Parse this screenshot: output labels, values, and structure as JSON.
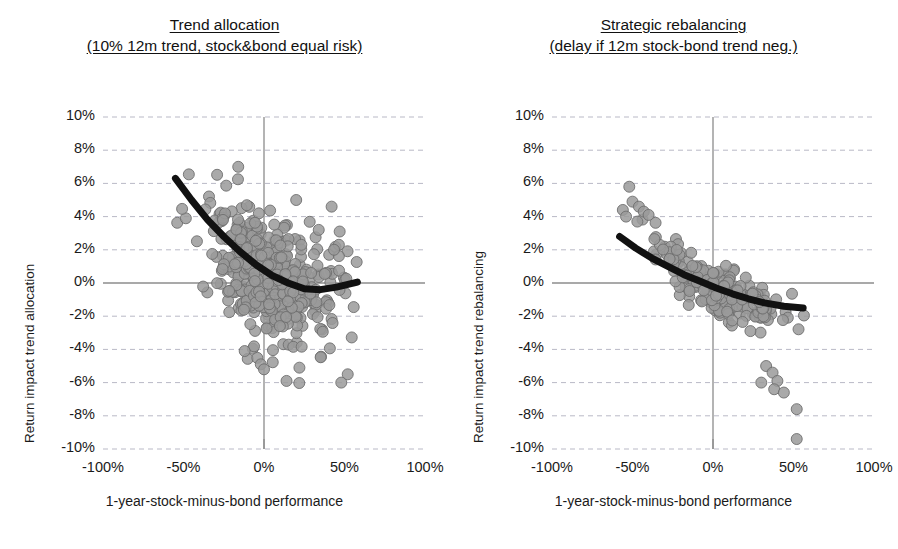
{
  "figure": {
    "width": 898,
    "height": 549,
    "background": "#ffffff",
    "point_color": "#9a9a9a",
    "point_edge_color": "#6e6e6e",
    "trend_color": "#111111",
    "gridline_color": "#b9b9c6",
    "axis_line_color": "#8c8c8c"
  },
  "panels": [
    {
      "id": "trend-allocation",
      "title_line1": "Trend allocation",
      "title_line2": "(10% 12m trend, stock&bond equal risk)",
      "ylabel": "Return impact trend allocation",
      "xlabel": "1-year-stock-minus-bond performance"
    },
    {
      "id": "strategic-rebalancing",
      "title_line1": "Strategic rebalancing",
      "title_line2": "(delay if 12m stock-bond trend neg.)",
      "ylabel": "Return impact trend rebalancing",
      "xlabel": "1-year-stock-minus-bond performance"
    }
  ],
  "chart_data": [
    {
      "type": "scatter",
      "panel": "left",
      "title": "Trend allocation (10% 12m trend, stock&bond equal risk)",
      "xlabel": "1-year-stock-minus-bond performance",
      "ylabel": "Return impact trend allocation",
      "xlim": [
        -100,
        100
      ],
      "ylim": [
        -10,
        10
      ],
      "xticks": [
        -100,
        -50,
        0,
        50,
        100
      ],
      "xtick_labels": [
        "-100%",
        "-50%",
        "0%",
        "50%",
        "100%"
      ],
      "yticks": [
        10,
        8,
        6,
        4,
        2,
        0,
        -2,
        -4,
        -6,
        -8,
        -10
      ],
      "ytick_labels": [
        "10%",
        "8%",
        "6%",
        "4%",
        "2%",
        "0%",
        "-2%",
        "-4%",
        "-6%",
        "-8%",
        "-10%"
      ],
      "grid": true,
      "grid_style": "dashed",
      "legend": false,
      "marker": {
        "shape": "circle",
        "size": 11,
        "fill": "#9a9a9a",
        "edge": "#6e6e6e",
        "opacity": 0.85
      },
      "n_points": 430,
      "cloud": {
        "x_mean": 2,
        "x_sd": 21,
        "x_min": -58,
        "x_max": 60,
        "intercept": 0.35,
        "slope": -0.052,
        "curve": 0.00075,
        "resid_sd": 1.85,
        "seed": 20231
      },
      "outliers": [
        {
          "x": -16,
          "y": 7.0
        },
        {
          "x": 20,
          "y": 5.0
        },
        {
          "x": 42,
          "y": 4.6
        },
        {
          "x": 34,
          "y": 3.2
        },
        {
          "x": 47,
          "y": 3.1
        },
        {
          "x": 52,
          "y": -5.5
        },
        {
          "x": 48,
          "y": -6.0
        },
        {
          "x": -12,
          "y": -4.1
        },
        {
          "x": -2,
          "y": -4.9
        },
        {
          "x": 0,
          "y": -5.2
        },
        {
          "x": 14,
          "y": -5.9
        },
        {
          "x": 22,
          "y": -5.1
        }
      ],
      "trend_line": {
        "label": "fitted quadratic trend",
        "type": "quadratic",
        "color": "#111111",
        "width": 7,
        "x_start": -55,
        "x_end": 58,
        "points": [
          {
            "x": -55,
            "y": 6.3
          },
          {
            "x": -45,
            "y": 5.0
          },
          {
            "x": -35,
            "y": 3.8
          },
          {
            "x": -25,
            "y": 2.8
          },
          {
            "x": -15,
            "y": 1.9
          },
          {
            "x": -5,
            "y": 1.1
          },
          {
            "x": 5,
            "y": 0.45
          },
          {
            "x": 15,
            "y": 0.0
          },
          {
            "x": 25,
            "y": -0.35
          },
          {
            "x": 35,
            "y": -0.4
          },
          {
            "x": 45,
            "y": -0.25
          },
          {
            "x": 58,
            "y": 0.05
          }
        ]
      }
    },
    {
      "type": "scatter",
      "panel": "right",
      "title": "Strategic rebalancing (delay if 12m stock-bond trend neg.)",
      "xlabel": "1-year-stock-minus-bond performance",
      "ylabel": "Return impact trend rebalancing",
      "xlim": [
        -100,
        100
      ],
      "ylim": [
        -10,
        10
      ],
      "xticks": [
        -100,
        -50,
        0,
        50,
        100
      ],
      "xtick_labels": [
        "-100%",
        "-50%",
        "0%",
        "50%",
        "100%"
      ],
      "yticks": [
        10,
        8,
        6,
        4,
        2,
        0,
        -2,
        -4,
        -6,
        -8,
        -10
      ],
      "ytick_labels": [
        "10%",
        "8%",
        "6%",
        "4%",
        "2%",
        "0%",
        "-2%",
        "-4%",
        "-6%",
        "-8%",
        "-10%"
      ],
      "grid": true,
      "grid_style": "dashed",
      "legend": false,
      "marker": {
        "shape": "circle",
        "size": 11,
        "fill": "#9a9a9a",
        "edge": "#6e6e6e",
        "opacity": 0.85
      },
      "n_points": 210,
      "cloud": {
        "x_mean": 3,
        "x_sd": 20,
        "x_min": -58,
        "x_max": 57,
        "intercept": -0.35,
        "slope": -0.052,
        "curve": 0.00035,
        "resid_sd": 0.72,
        "seed": 7781
      },
      "outliers": [
        {
          "x": -52,
          "y": 5.8
        },
        {
          "x": -50,
          "y": 4.9
        },
        {
          "x": -56,
          "y": 4.4
        },
        {
          "x": -46,
          "y": 4.6
        },
        {
          "x": -43,
          "y": 4.3
        },
        {
          "x": -40,
          "y": 4.1
        },
        {
          "x": -54,
          "y": 4.0
        },
        {
          "x": -47,
          "y": 3.7
        },
        {
          "x": 33,
          "y": -5.0
        },
        {
          "x": 37,
          "y": -5.4
        },
        {
          "x": 40,
          "y": -5.9
        },
        {
          "x": 30,
          "y": -6.0
        },
        {
          "x": 38,
          "y": -6.4
        },
        {
          "x": 44,
          "y": -6.6
        },
        {
          "x": 52,
          "y": -7.6
        },
        {
          "x": 52,
          "y": -9.4
        }
      ],
      "trend_line": {
        "label": "fitted quadratic trend",
        "type": "quadratic",
        "color": "#111111",
        "width": 7,
        "x_start": -58,
        "x_end": 56,
        "points": [
          {
            "x": -58,
            "y": 2.8
          },
          {
            "x": -48,
            "y": 2.1
          },
          {
            "x": -38,
            "y": 1.5
          },
          {
            "x": -28,
            "y": 1.0
          },
          {
            "x": -18,
            "y": 0.5
          },
          {
            "x": -8,
            "y": 0.1
          },
          {
            "x": 2,
            "y": -0.3
          },
          {
            "x": 12,
            "y": -0.65
          },
          {
            "x": 22,
            "y": -0.95
          },
          {
            "x": 32,
            "y": -1.2
          },
          {
            "x": 44,
            "y": -1.4
          },
          {
            "x": 56,
            "y": -1.5
          }
        ]
      }
    }
  ]
}
